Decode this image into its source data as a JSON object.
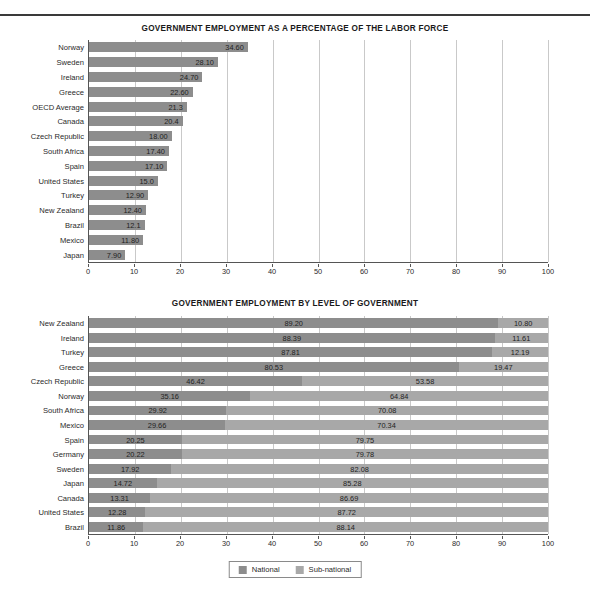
{
  "page": {
    "background_color": "#ffffff",
    "rule_color": "#3a3a3a"
  },
  "colors": {
    "national": "#8d8d8d",
    "subnational": "#a8a8a8",
    "gridline": "#c9c9c9",
    "axis": "#555555",
    "text": "#2a2a2a"
  },
  "legend": {
    "items": [
      {
        "label": "National",
        "swatch": "national"
      },
      {
        "label": "Sub-national",
        "swatch": "subnational"
      }
    ]
  },
  "footer": {
    "text": ""
  },
  "chart_data": [
    {
      "id": "chart1",
      "type": "bar",
      "orientation": "horizontal",
      "title": "GOVERNMENT EMPLOYMENT AS A PERCENTAGE OF THE LABOR FORCE",
      "xlabel": "",
      "ylabel": "",
      "xlim": [
        0,
        100
      ],
      "xticks": [
        0,
        10,
        20,
        30,
        40,
        50,
        60,
        70,
        80,
        90,
        100
      ],
      "xtick_labels": [
        "0",
        "10",
        "20",
        "30",
        "40",
        "50",
        "60",
        "70",
        "80",
        "90",
        "100"
      ],
      "grid": true,
      "legend_position": "none",
      "categories": [
        "Norway",
        "Sweden",
        "Ireland",
        "Greece",
        "OECD Average",
        "Canada",
        "Czech Republic",
        "South Africa",
        "Spain",
        "United States",
        "Turkey",
        "New Zealand",
        "Brazil",
        "Mexico",
        "Japan"
      ],
      "values": [
        34.6,
        28.1,
        24.7,
        22.6,
        21.3,
        20.4,
        18.0,
        17.4,
        17.1,
        15.0,
        12.9,
        12.4,
        12.1,
        11.8,
        7.9
      ],
      "value_labels": [
        "34.60",
        "28.10",
        "24.70",
        "22.60",
        "21.3",
        "20.4",
        "18.00",
        "17.40",
        "17.10",
        "15.0",
        "12.90",
        "12.40",
        "12.1",
        "11.80",
        "7.90"
      ]
    },
    {
      "id": "chart2",
      "type": "bar",
      "orientation": "horizontal",
      "stacked": true,
      "title": "GOVERNMENT EMPLOYMENT BY LEVEL OF GOVERNMENT",
      "xlabel": "",
      "ylabel": "",
      "xlim": [
        0,
        100
      ],
      "xticks": [
        0,
        10,
        20,
        30,
        40,
        50,
        60,
        70,
        80,
        90,
        100
      ],
      "xtick_labels": [
        "0",
        "10",
        "20",
        "30",
        "40",
        "50",
        "60",
        "70",
        "80",
        "90",
        "100"
      ],
      "grid": true,
      "legend_position": "bottom",
      "categories": [
        "New Zealand",
        "Ireland",
        "Turkey",
        "Greece",
        "Czech Republic",
        "Norway",
        "South Africa",
        "Mexico",
        "Spain",
        "Germany",
        "Sweden",
        "Japan",
        "Canada",
        "United States",
        "Brazil"
      ],
      "series": [
        {
          "name": "National",
          "values": [
            89.2,
            88.39,
            87.81,
            80.53,
            46.42,
            35.16,
            29.92,
            29.66,
            20.25,
            20.22,
            17.92,
            14.72,
            13.31,
            12.28,
            11.86
          ],
          "value_labels": [
            "89.20",
            "88.39",
            "87.81",
            "80.53",
            "46.42",
            "35.16",
            "29.92",
            "29.66",
            "20.25",
            "20.22",
            "17.92",
            "14.72",
            "13.31",
            "12.28",
            "11.86"
          ]
        },
        {
          "name": "Sub-national",
          "values": [
            10.8,
            11.61,
            12.19,
            19.47,
            53.58,
            64.84,
            70.08,
            70.34,
            79.75,
            79.78,
            82.08,
            85.28,
            86.69,
            87.72,
            88.14
          ],
          "value_labels": [
            "10.80",
            "11.61",
            "12.19",
            "19.47",
            "53.58",
            "64.84",
            "70.08",
            "70.34",
            "79.75",
            "79.78",
            "82.08",
            "85.28",
            "86.69",
            "87.72",
            "88.14"
          ]
        }
      ]
    }
  ]
}
